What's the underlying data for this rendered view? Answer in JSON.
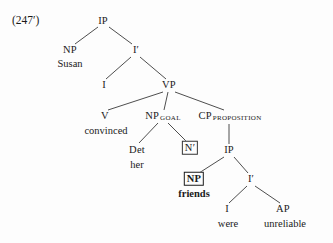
{
  "figure": {
    "example_number": "(247′)",
    "type": "syntax-tree",
    "background_color": "#fdfdfd",
    "line_color": "#3a3a3a",
    "text_color": "#1a1a1a"
  },
  "nodes": [
    {
      "id": "ip-root",
      "label": "IP",
      "sub": "",
      "x": 103,
      "y": 21,
      "boxed": false,
      "bold": false
    },
    {
      "id": "np-subj",
      "label": "NP",
      "sub": "",
      "x": 70,
      "y": 50,
      "boxed": false,
      "bold": false
    },
    {
      "id": "ibar",
      "label": "I′",
      "sub": "",
      "x": 136,
      "y": 50,
      "boxed": false,
      "bold": false
    },
    {
      "id": "i-matrix",
      "label": "I",
      "sub": "",
      "x": 104,
      "y": 85,
      "boxed": false,
      "bold": false
    },
    {
      "id": "vp",
      "label": "VP",
      "sub": "",
      "x": 169,
      "y": 85,
      "boxed": false,
      "bold": false
    },
    {
      "id": "v",
      "label": "V",
      "sub": "",
      "x": 105,
      "y": 116,
      "boxed": false,
      "bold": false
    },
    {
      "id": "np-goal",
      "label": "NP",
      "sub": "GOAL",
      "x": 163,
      "y": 116,
      "boxed": false,
      "bold": false
    },
    {
      "id": "cp-prop",
      "label": "CP",
      "sub": "PROPOSITION",
      "x": 230,
      "y": 116,
      "boxed": false,
      "bold": false
    },
    {
      "id": "det",
      "label": "Det",
      "sub": "",
      "x": 137,
      "y": 150,
      "boxed": false,
      "bold": false
    },
    {
      "id": "nbar",
      "label": "N′",
      "sub": "",
      "x": 190,
      "y": 148,
      "boxed": true,
      "bold": false
    },
    {
      "id": "ip-embedded",
      "label": "IP",
      "sub": "",
      "x": 229,
      "y": 150,
      "boxed": false,
      "bold": false
    },
    {
      "id": "np-friends",
      "label": "NP",
      "sub": "",
      "x": 194,
      "y": 179,
      "boxed": true,
      "bold": true
    },
    {
      "id": "ibar-emb",
      "label": "I′",
      "sub": "",
      "x": 251,
      "y": 179,
      "boxed": false,
      "bold": false
    },
    {
      "id": "i-embedded",
      "label": "I",
      "sub": "",
      "x": 227,
      "y": 209,
      "boxed": false,
      "bold": false
    },
    {
      "id": "ap",
      "label": "AP",
      "sub": "",
      "x": 283,
      "y": 209,
      "boxed": false,
      "bold": false
    }
  ],
  "terminals": [
    {
      "id": "susan",
      "text": "Susan",
      "x": 70,
      "y": 64,
      "bold": false
    },
    {
      "id": "convinced",
      "text": "convinced",
      "x": 106,
      "y": 131,
      "bold": false
    },
    {
      "id": "her",
      "text": "her",
      "x": 137,
      "y": 165,
      "bold": false
    },
    {
      "id": "friends",
      "text": "friends",
      "x": 194,
      "y": 194,
      "bold": true
    },
    {
      "id": "were",
      "text": "were",
      "x": 228,
      "y": 224,
      "bold": false
    },
    {
      "id": "unreliable",
      "text": "unreliable",
      "x": 285,
      "y": 224,
      "bold": false
    }
  ],
  "edges": [
    {
      "id": "ip-to-np-subj",
      "x1": 98,
      "y1": 27,
      "x2": 75,
      "y2": 44
    },
    {
      "id": "ip-to-ibar",
      "x1": 109,
      "y1": 27,
      "x2": 132,
      "y2": 44
    },
    {
      "id": "ibar-to-i",
      "x1": 131,
      "y1": 57,
      "x2": 106,
      "y2": 79
    },
    {
      "id": "ibar-to-vp",
      "x1": 140,
      "y1": 57,
      "x2": 166,
      "y2": 79
    },
    {
      "id": "vp-to-v",
      "x1": 163,
      "y1": 92,
      "x2": 108,
      "y2": 110
    },
    {
      "id": "vp-to-np-goal",
      "x1": 168,
      "y1": 92,
      "x2": 164,
      "y2": 110
    },
    {
      "id": "vp-to-cp",
      "x1": 175,
      "y1": 92,
      "x2": 224,
      "y2": 110
    },
    {
      "id": "np-goal-to-det",
      "x1": 158,
      "y1": 123,
      "x2": 139,
      "y2": 143
    },
    {
      "id": "np-goal-to-nbar",
      "x1": 168,
      "y1": 123,
      "x2": 186,
      "y2": 141
    },
    {
      "id": "cp-to-ip",
      "x1": 229,
      "y1": 124,
      "x2": 229,
      "y2": 144
    },
    {
      "id": "ip-emb-to-np",
      "x1": 224,
      "y1": 157,
      "x2": 199,
      "y2": 173
    },
    {
      "id": "ip-emb-to-ibar",
      "x1": 234,
      "y1": 157,
      "x2": 248,
      "y2": 173
    },
    {
      "id": "ibar-emb-to-i",
      "x1": 247,
      "y1": 186,
      "x2": 229,
      "y2": 203
    },
    {
      "id": "ibar-emb-to-ap",
      "x1": 255,
      "y1": 186,
      "x2": 280,
      "y2": 203
    }
  ],
  "sentence": {
    "matrix": "Susan convinced her friends were unreliable",
    "gloss": "Susan convinced her N' [IP friends were unreliable]"
  }
}
